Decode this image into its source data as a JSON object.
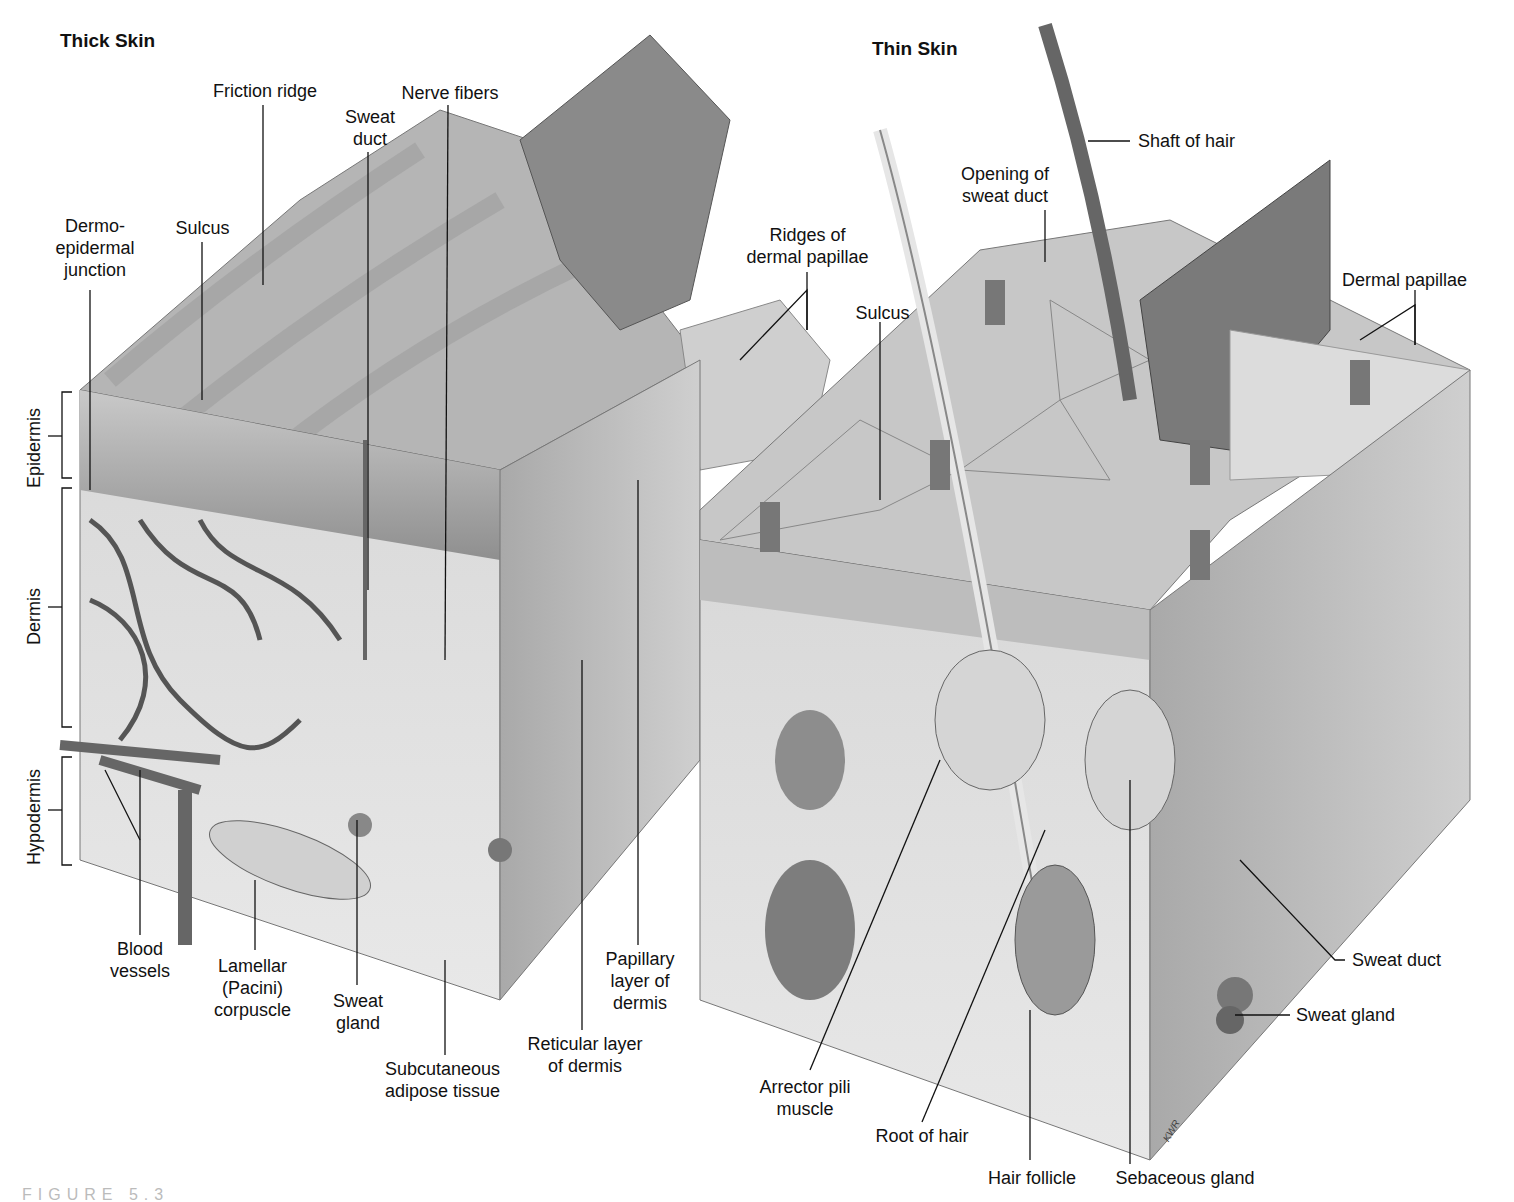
{
  "figure": {
    "caption_fragment": "FIGURE 5.3",
    "panels": [
      {
        "title": "Thick Skin",
        "layer_brackets": [
          "Epidermis",
          "Dermis",
          "Hypodermis"
        ],
        "labels": [
          "Friction ridge",
          "Nerve fibers",
          "Sweat\nduct",
          "Dermo-\nepidermal\njunction",
          "Sulcus",
          "Ridges of\ndermal papillae",
          "Blood\nvessels",
          "Lamellar\n(Pacini)\ncorpuscle",
          "Sweat\ngland",
          "Subcutaneous\nadipose tissue",
          "Reticular layer\nof dermis",
          "Papillary\nlayer of\ndermis"
        ]
      },
      {
        "title": "Thin Skin",
        "labels": [
          "Shaft of hair",
          "Opening of\nsweat duct",
          "Sulcus",
          "Dermal papillae",
          "Sweat duct",
          "Sweat gland",
          "Arrector pili\nmuscle",
          "Root of hair",
          "Hair follicle",
          "Sebaceous gland"
        ],
        "artist_signature": "KWR"
      }
    ]
  }
}
